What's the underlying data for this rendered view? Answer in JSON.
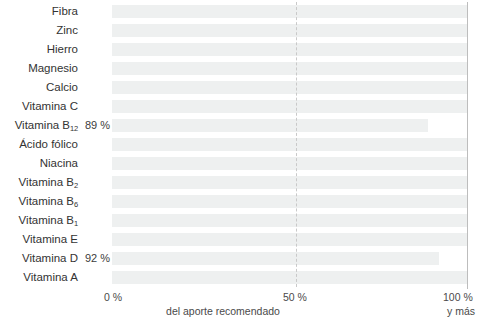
{
  "chart_data": {
    "type": "bar",
    "orientation": "horizontal",
    "title": "",
    "subtitle": "",
    "xlabel": "del aporte recomendado",
    "ylabel": "",
    "xlim": [
      0,
      100
    ],
    "grid": true,
    "gridlines": [
      50,
      100
    ],
    "legend": null,
    "axis_caption": "del aporte recomendado",
    "tick_labels": {
      "zero": "0 %",
      "fifty": "50 %",
      "hundred": "100 %",
      "hundred_sub": "y más"
    },
    "categories": [
      "Fibra",
      "Zinc",
      "Hierro",
      "Magnesio",
      "Calcio",
      "Vitamina C",
      "Vitamina B12",
      "Ácido fólico",
      "Niacina",
      "Vitamina B2",
      "Vitamina B6",
      "Vitamina B1",
      "Vitamina E",
      "Vitamina D",
      "Vitamina A"
    ],
    "values": [
      100,
      100,
      100,
      100,
      100,
      100,
      89,
      100,
      100,
      100,
      100,
      100,
      100,
      92,
      100
    ],
    "bar_color": "#eef0f0",
    "rows": [
      {
        "name": "Fibra",
        "base": "Fibra",
        "sub": "",
        "value": 100,
        "value_label": ""
      },
      {
        "name": "Zinc",
        "base": "Zinc",
        "sub": "",
        "value": 100,
        "value_label": ""
      },
      {
        "name": "Hierro",
        "base": "Hierro",
        "sub": "",
        "value": 100,
        "value_label": ""
      },
      {
        "name": "Magnesio",
        "base": "Magnesio",
        "sub": "",
        "value": 100,
        "value_label": ""
      },
      {
        "name": "Calcio",
        "base": "Calcio",
        "sub": "",
        "value": 100,
        "value_label": ""
      },
      {
        "name": "Vitamina C",
        "base": "Vitamina C",
        "sub": "",
        "value": 100,
        "value_label": ""
      },
      {
        "name": "Vitamina B12",
        "base": "Vitamina B",
        "sub": "12",
        "value": 89,
        "value_label": "89 %"
      },
      {
        "name": "Ácido fólico",
        "base": "Ácido fólico",
        "sub": "",
        "value": 100,
        "value_label": ""
      },
      {
        "name": "Niacina",
        "base": "Niacina",
        "sub": "",
        "value": 100,
        "value_label": ""
      },
      {
        "name": "Vitamina B2",
        "base": "Vitamina B",
        "sub": "2",
        "value": 100,
        "value_label": ""
      },
      {
        "name": "Vitamina B6",
        "base": "Vitamina B",
        "sub": "6",
        "value": 100,
        "value_label": ""
      },
      {
        "name": "Vitamina B1",
        "base": "Vitamina B",
        "sub": "1",
        "value": 100,
        "value_label": ""
      },
      {
        "name": "Vitamina E",
        "base": "Vitamina E",
        "sub": "",
        "value": 100,
        "value_label": ""
      },
      {
        "name": "Vitamina D",
        "base": "Vitamina D",
        "sub": "",
        "value": 92,
        "value_label": "92 %"
      },
      {
        "name": "Vitamina A",
        "base": "Vitamina A",
        "sub": "",
        "value": 100,
        "value_label": ""
      }
    ]
  }
}
